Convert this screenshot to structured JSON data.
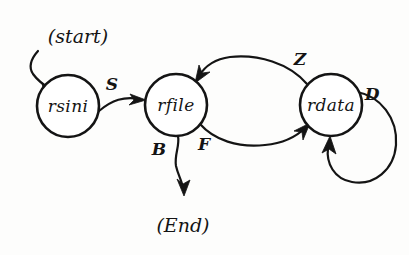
{
  "diagram": {
    "style": "hand-drawn pen sketch",
    "ink_color": "#141414",
    "background_color": "#fdfdfc",
    "terminals": {
      "start_label": "(start)",
      "end_label": "(End)"
    },
    "nodes": [
      {
        "id": "rsini",
        "label": "rsini",
        "cx": 68,
        "cy": 106,
        "r": 31
      },
      {
        "id": "rfile",
        "label": "rfile",
        "cx": 176,
        "cy": 105,
        "r": 31
      },
      {
        "id": "rdata",
        "label": "rdata",
        "cx": 331,
        "cy": 105,
        "r": 31
      }
    ],
    "edges": [
      {
        "id": "start-to-rsini",
        "from": "(start)",
        "to": "rsini",
        "label": "",
        "shape": "curved-down"
      },
      {
        "id": "rsini-to-rfile",
        "from": "rsini",
        "to": "rfile",
        "label": "S",
        "shape": "shallow-arc"
      },
      {
        "id": "rfile-to-rdata",
        "from": "rfile",
        "to": "rdata",
        "label": "F",
        "shape": "lower-arc"
      },
      {
        "id": "rdata-to-rfile",
        "from": "rdata",
        "to": "rfile",
        "label": "Z",
        "shape": "upper-arc"
      },
      {
        "id": "rdata-self-loop",
        "from": "rdata",
        "to": "rdata",
        "label": "D",
        "shape": "self-loop"
      },
      {
        "id": "rfile-to-end",
        "from": "rfile",
        "to": "(End)",
        "label": "B",
        "shape": "down-wiggle"
      }
    ],
    "edge_labels": {
      "s": "S",
      "z": "Z",
      "f": "F",
      "b": "B",
      "d": "D"
    }
  }
}
